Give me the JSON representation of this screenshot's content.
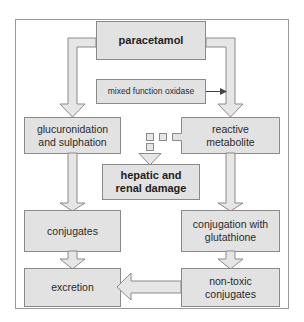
{
  "colors": {
    "box_fill": "#e2e2e2",
    "box_stroke": "#8a8a8a",
    "arrow_fill": "#e6e6e6",
    "frame_stroke": "#9a9a9a",
    "text": "#2a2a2a",
    "small_arrow": "#444444"
  },
  "nodes": {
    "paracetamol": "paracetamol",
    "mixed_function_oxidase": "mixed function oxidase",
    "glucuronidation": "glucuronidation\nand sulphation",
    "reactive_metabolite": "reactive\nmetabolite",
    "hepatic_damage": "hepatic and\nrenal damage",
    "conjugates": "conjugates",
    "conjugation_glutathione": "conjugation with\nglutathione",
    "excretion": "excretion",
    "non_toxic_conjugates": "non-toxic\nconjugates"
  }
}
